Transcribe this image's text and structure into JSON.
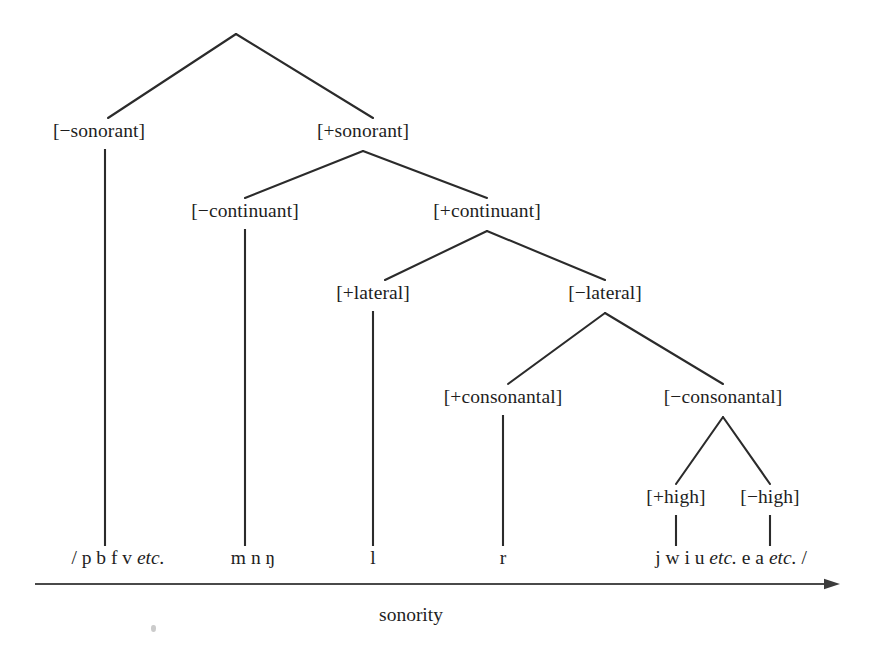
{
  "diagram": {
    "title_text": "sonority",
    "speck_artifact": "scan-speck"
  },
  "nodes": {
    "root": {
      "label": "",
      "x": 236,
      "y": 34
    },
    "minus_sonorant": {
      "label": "[−sonorant]",
      "x": 99,
      "y": 131
    },
    "plus_sonorant": {
      "label": "[+sonorant]",
      "x": 363,
      "y": 131
    },
    "minus_continuant": {
      "label": "[−continuant]",
      "x": 245,
      "y": 211
    },
    "plus_continuant": {
      "label": "[+continuant]",
      "x": 487,
      "y": 211
    },
    "plus_lateral": {
      "label": "[+lateral]",
      "x": 373,
      "y": 293
    },
    "minus_lateral": {
      "label": "[−lateral]",
      "x": 605,
      "y": 293
    },
    "plus_consonantal": {
      "label": "[+consonantal]",
      "x": 503,
      "y": 397
    },
    "minus_consonantal": {
      "label": "[−consonantal]",
      "x": 723,
      "y": 397
    },
    "plus_high": {
      "label": "[+high]",
      "x": 676,
      "y": 497
    },
    "minus_high": {
      "label": "[−high]",
      "x": 770,
      "y": 497
    }
  },
  "terminals": [
    {
      "name": "obstruents",
      "x": 118,
      "y": 560,
      "parts": [
        {
          "text": "/ p b f v ",
          "italic": false
        },
        {
          "text": "etc.",
          "italic": true
        }
      ]
    },
    {
      "name": "nasals",
      "x": 253,
      "y": 560,
      "parts": [
        {
          "text": "m n ŋ",
          "italic": false
        }
      ]
    },
    {
      "name": "lateral",
      "x": 373,
      "y": 560,
      "parts": [
        {
          "text": "l",
          "italic": false
        }
      ]
    },
    {
      "name": "rhotic",
      "x": 503,
      "y": 560,
      "parts": [
        {
          "text": "r",
          "italic": false
        }
      ]
    },
    {
      "name": "vowels-glides",
      "x": 731,
      "y": 560,
      "parts": [
        {
          "text": "j w i u ",
          "italic": false
        },
        {
          "text": "etc.",
          "italic": true
        },
        {
          "text": " e a ",
          "italic": false
        },
        {
          "text": "etc.",
          "italic": true
        },
        {
          "text": " /",
          "italic": false
        }
      ]
    }
  ],
  "axis": {
    "label": "sonority",
    "label_x": 411,
    "label_y": 615,
    "x_start": 35,
    "x_end": 840,
    "y": 584
  },
  "branches": [
    {
      "from": "root",
      "to": "minus_sonorant",
      "x1": 236,
      "y1": 34,
      "x2": 108,
      "y2": 118
    },
    {
      "from": "root",
      "to": "plus_sonorant",
      "x1": 236,
      "y1": 34,
      "x2": 373,
      "y2": 118
    },
    {
      "from": "plus_sonorant",
      "to": "minus_continuant",
      "x1": 363,
      "y1": 151,
      "x2": 245,
      "y2": 198
    },
    {
      "from": "plus_sonorant",
      "to": "plus_continuant",
      "x1": 363,
      "y1": 151,
      "x2": 487,
      "y2": 198
    },
    {
      "from": "plus_continuant",
      "to": "plus_lateral",
      "x1": 487,
      "y1": 231,
      "x2": 385,
      "y2": 280
    },
    {
      "from": "plus_continuant",
      "to": "minus_lateral",
      "x1": 487,
      "y1": 231,
      "x2": 605,
      "y2": 280
    },
    {
      "from": "minus_lateral",
      "to": "plus_consonantal",
      "x1": 605,
      "y1": 313,
      "x2": 508,
      "y2": 384
    },
    {
      "from": "minus_lateral",
      "to": "minus_consonantal",
      "x1": 605,
      "y1": 313,
      "x2": 723,
      "y2": 384
    },
    {
      "from": "minus_consonantal",
      "to": "plus_high",
      "x1": 723,
      "y1": 417,
      "x2": 676,
      "y2": 484
    },
    {
      "from": "minus_consonantal",
      "to": "minus_high",
      "x1": 723,
      "y1": 417,
      "x2": 770,
      "y2": 484
    }
  ],
  "stems": [
    {
      "node": "minus_sonorant",
      "x": 105,
      "y1": 149,
      "y2": 546
    },
    {
      "node": "minus_continuant",
      "x": 245,
      "y1": 229,
      "y2": 546
    },
    {
      "node": "plus_lateral",
      "x": 373,
      "y1": 311,
      "y2": 546
    },
    {
      "node": "plus_consonantal",
      "x": 503,
      "y1": 415,
      "y2": 546
    },
    {
      "node": "plus_high",
      "x": 676,
      "y1": 515,
      "y2": 546
    },
    {
      "node": "minus_high",
      "x": 770,
      "y1": 515,
      "y2": 546
    }
  ],
  "colors": {
    "ink": "#1e1e1e",
    "line": "#2b2b2b",
    "axis": "#4a4a4a",
    "background": "#ffffff"
  }
}
